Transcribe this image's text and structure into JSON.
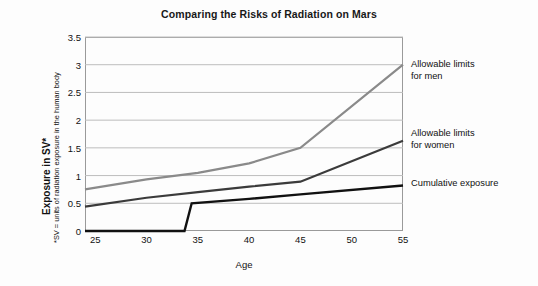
{
  "chart_data": {
    "type": "line",
    "title": "Comparing the Risks of Radiation on Mars",
    "xlabel": "Age",
    "ylabel": "Exposure in SV*",
    "ylabel_note": "*SV = units of radiation exposure in the human body",
    "xlim": [
      24,
      55
    ],
    "ylim": [
      0,
      3.5
    ],
    "xticks": [
      25,
      30,
      35,
      40,
      45,
      50,
      55
    ],
    "yticks": [
      "0",
      "0.5",
      "1",
      "1.5",
      "2",
      "2.5",
      "3",
      "3.5"
    ],
    "ytick_values": [
      0,
      0.5,
      1,
      1.5,
      2,
      2.5,
      3,
      3.5
    ],
    "grid": "horizontal",
    "legend_position": "right-inline-annotations",
    "series": [
      {
        "name": "Allowable limits for men",
        "color": "#8a8a8a",
        "width": 2.2,
        "x": [
          24,
          30,
          35,
          40,
          45,
          55
        ],
        "y": [
          0.75,
          0.93,
          1.05,
          1.22,
          1.5,
          3.0
        ]
      },
      {
        "name": "Allowable limits for women",
        "color": "#3b3b3b",
        "width": 2.2,
        "x": [
          24,
          30,
          35,
          40,
          45,
          55
        ],
        "y": [
          0.44,
          0.6,
          0.7,
          0.8,
          0.89,
          1.63
        ]
      },
      {
        "name": "Cumulative exposure",
        "color": "#111111",
        "width": 2.4,
        "x": [
          24,
          33.7,
          34.4,
          40,
          45,
          55
        ],
        "y": [
          0.0,
          0.0,
          0.5,
          0.58,
          0.66,
          0.82
        ]
      }
    ],
    "annotations": [
      {
        "id": "men",
        "line1": "Allowable limits",
        "line2": "for men"
      },
      {
        "id": "women",
        "line1": "Allowable limits",
        "line2": "for women"
      },
      {
        "id": "cum",
        "line1": "Cumulative exposure",
        "line2": ""
      }
    ],
    "colors": {
      "men": "#8a8a8a",
      "women": "#3b3b3b",
      "cumulative": "#111111",
      "grid": "#bdbdbd",
      "frame": "#9a9a9a",
      "background": "#fdfdfd"
    }
  }
}
